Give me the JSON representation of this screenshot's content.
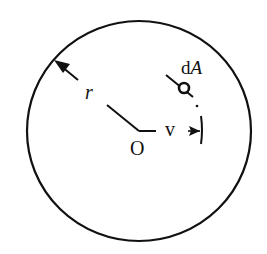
{
  "diagram": {
    "title": "",
    "labels": {
      "radius": "r",
      "center": "O",
      "distance": "v",
      "area_element_prefix": "d",
      "area_element_var": "A"
    },
    "colors": {
      "stroke": "#111111",
      "background": "#ffffff"
    }
  }
}
